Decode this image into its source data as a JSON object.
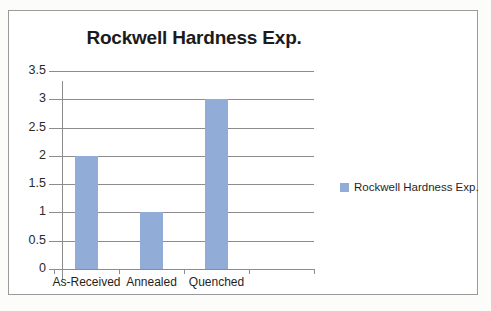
{
  "chart_data": {
    "type": "bar",
    "title": "Rockwell Hardness Exp.",
    "categories": [
      "As-Received",
      "Annealed",
      "Quenched",
      ""
    ],
    "values": [
      2,
      1,
      3,
      null
    ],
    "series": [
      {
        "name": "Rockwell Hardness Exp.",
        "values": [
          2,
          1,
          3,
          null
        ]
      }
    ],
    "xlabel": "",
    "ylabel": "",
    "ylim": [
      0,
      3.5
    ],
    "yticks": [
      "0",
      "0.5",
      "1",
      "1.5",
      "2",
      "2.5",
      "3",
      "3.5"
    ],
    "ytick_values": [
      0,
      0.5,
      1,
      1.5,
      2,
      2.5,
      3,
      3.5
    ],
    "grid": true,
    "legend": {
      "position": "right",
      "entries": [
        {
          "label": "Rockwell Hardness Exp.",
          "color": "#92acd8"
        }
      ]
    },
    "colors": {
      "bar": "#92acd8",
      "grid": "#8c8c8c",
      "axis": "#8c8c8c",
      "text": "#1f1f1f",
      "frame": "#9a9a9a",
      "plot_background": "#ffffff"
    }
  }
}
